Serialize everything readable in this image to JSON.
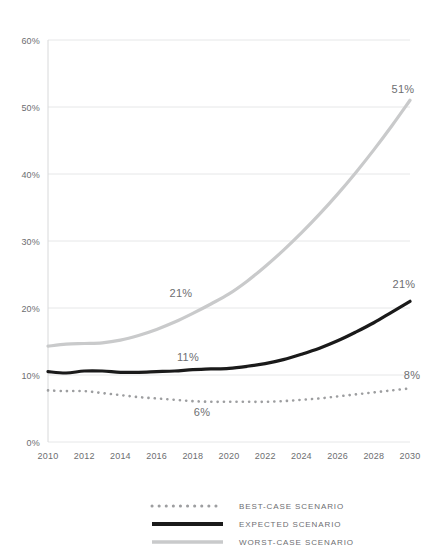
{
  "chart_data": {
    "type": "line",
    "title": "",
    "subtitle": "",
    "xlabel": "",
    "ylabel": "",
    "xlim": [
      2010,
      2030
    ],
    "ylim": [
      0,
      60
    ],
    "grid": true,
    "y_tick_labels": [
      "60%",
      "50%",
      "40%",
      "30%",
      "20%",
      "10%",
      "0%"
    ],
    "y_tick_values": [
      60,
      50,
      40,
      30,
      20,
      10,
      0
    ],
    "x_tick_labels": [
      "2010",
      "2012",
      "2014",
      "2016",
      "2018",
      "2020",
      "2022",
      "2024",
      "2026",
      "2028",
      "2030"
    ],
    "x_tick_values": [
      2010,
      2012,
      2014,
      2016,
      2018,
      2020,
      2022,
      2024,
      2026,
      2028,
      2030
    ],
    "x": [
      2010,
      2011,
      2012,
      2013,
      2014,
      2015,
      2016,
      2017,
      2018,
      2019,
      2020,
      2021,
      2022,
      2023,
      2024,
      2025,
      2026,
      2027,
      2028,
      2029,
      2030
    ],
    "series": [
      {
        "name": "BEST-CASE SCENARIO",
        "style": "dotted",
        "color": "#9d9ea0",
        "values": [
          7.7,
          7.6,
          7.6,
          7.3,
          7.0,
          6.7,
          6.5,
          6.3,
          6.1,
          6.0,
          6.0,
          6.0,
          6.0,
          6.1,
          6.3,
          6.5,
          6.8,
          7.1,
          7.4,
          7.7,
          8.0
        ]
      },
      {
        "name": "EXPECTED SCENARIO",
        "style": "solid",
        "color": "#1a1a1a",
        "values": [
          10.5,
          10.3,
          10.6,
          10.6,
          10.4,
          10.4,
          10.5,
          10.6,
          10.8,
          10.9,
          11.0,
          11.3,
          11.7,
          12.3,
          13.1,
          14.0,
          15.1,
          16.4,
          17.8,
          19.4,
          21.0
        ]
      },
      {
        "name": "WORST-CASE SCENARIO",
        "style": "solid",
        "color": "#c9cacb",
        "values": [
          14.3,
          14.6,
          14.7,
          14.8,
          15.2,
          15.9,
          16.8,
          17.9,
          19.2,
          20.6,
          22.1,
          24.0,
          26.2,
          28.6,
          31.2,
          34.0,
          37.0,
          40.2,
          43.6,
          47.2,
          51.0
        ]
      }
    ],
    "annotations": [
      {
        "name": "worst-case-mid-label",
        "text": "21%",
        "x_px": 181,
        "y_px": 297
      },
      {
        "name": "expected-mid-label",
        "text": "11%",
        "x_px": 188,
        "y_px": 361
      },
      {
        "name": "best-case-mid-label",
        "text": "6%",
        "x_px": 202,
        "y_px": 416
      },
      {
        "name": "worst-case-end-label",
        "text": "51%",
        "x_px": 403,
        "y_px": 93
      },
      {
        "name": "expected-end-label",
        "text": "21%",
        "x_px": 404,
        "y_px": 288
      },
      {
        "name": "best-case-end-label",
        "text": "8%",
        "x_px": 412,
        "y_px": 379
      }
    ],
    "legend": {
      "position": "bottom",
      "entries": [
        {
          "label": "BEST-CASE SCENARIO",
          "style": "dotted",
          "color": "#9d9ea0"
        },
        {
          "label": "EXPECTED SCENARIO",
          "style": "solid",
          "color": "#1a1a1a"
        },
        {
          "label": "WORST-CASE SCENARIO",
          "style": "solid",
          "color": "#c9cacb"
        }
      ]
    }
  }
}
